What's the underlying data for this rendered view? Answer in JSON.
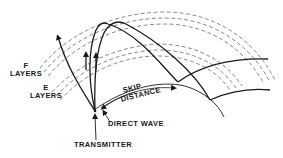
{
  "diagram": {
    "colors": {
      "ink": "#1a1a1a",
      "dashed": "#6e6e6e",
      "background": "#ffffff"
    },
    "labels": {
      "f_layers_line1": "F",
      "f_layers_line2": "LAYERS",
      "e_layers_line1": "E",
      "e_layers_line2": "LAYERS",
      "skip_line1": "SKIP",
      "skip_line2": "DISTANCE",
      "direct_wave": "DIRECT WAVE",
      "transmitter": "TRANSMITTER"
    },
    "layers": [
      {
        "name": "F layers",
        "count": 3,
        "style": "dashed"
      },
      {
        "name": "E layers",
        "count": 3,
        "style": "dashed"
      }
    ],
    "elements": [
      "earth-surface-arc",
      "transmitter-point",
      "escaping-ray",
      "reflected-ray-1",
      "reflected-ray-2",
      "skip-distance-arrow",
      "direct-wave-arrow"
    ]
  }
}
